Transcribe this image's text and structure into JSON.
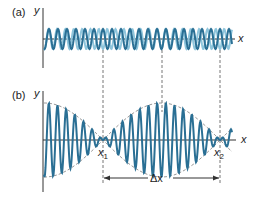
{
  "panel_a": {
    "label": "(a)",
    "y_label": "y",
    "x_label": "x"
  },
  "panel_b": {
    "label": "(b)",
    "y_label": "y",
    "x_label": "x",
    "node1_label": "x",
    "node1_sub": "1",
    "node2_label": "x",
    "node2_sub": "2",
    "delta_label": "Δx"
  },
  "colors": {
    "wave_dark": "#2a6f94",
    "wave_light": "#8ec5dc",
    "axis": "#333333",
    "dashed": "#777777",
    "envelope": "#999999"
  }
}
